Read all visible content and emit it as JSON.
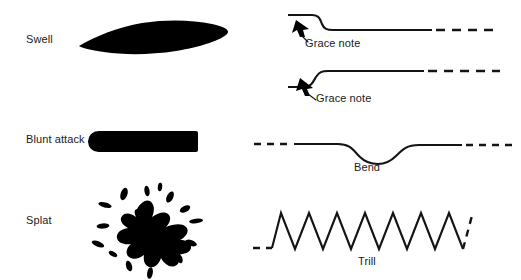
{
  "figure": {
    "background_color": "#ffffff",
    "ink_color": "#000000",
    "width": 521,
    "height": 280
  },
  "left_column": {
    "items": [
      {
        "id": "swell",
        "label": "Swell",
        "shape": "lens",
        "label_x": 26,
        "label_y": 40,
        "glyph_desc": "solid black lens / eye shape, pointed left tip, tapered right tip"
      },
      {
        "id": "blunt-attack",
        "label": "Blunt attack",
        "shape": "rounded-bar",
        "label_x": 26,
        "label_y": 140,
        "glyph_desc": "solid black horizontal bar with rounded ends"
      },
      {
        "id": "splat",
        "label": "Splat",
        "shape": "ink-splatter",
        "label_x": 26,
        "label_y": 221,
        "glyph_desc": "black ink splatter with radiating droplets"
      }
    ]
  },
  "right_column": {
    "items": [
      {
        "id": "grace-note-down",
        "label": "Grace note",
        "shape": "step-down-curve",
        "label_x": 305,
        "label_y": 44,
        "glyph_desc": "short high plateau stepping down to a long low line ending in dashes",
        "has_arrow": true,
        "dashed_tail": true
      },
      {
        "id": "grace-note-up",
        "label": "Grace note",
        "shape": "step-up-curve",
        "label_x": 315,
        "label_y": 99,
        "glyph_desc": "short low plateau stepping up to a long high line ending in dashes",
        "has_arrow": true,
        "dashed_tail": true
      },
      {
        "id": "bend",
        "label": "Bend",
        "shape": "dip-curve",
        "label_x": 355,
        "label_y": 168,
        "glyph_desc": "dashed line, solid line with a downward dip, returning to dashed line",
        "has_arrow": false,
        "dashed_tail": true
      },
      {
        "id": "trill",
        "label": "Trill",
        "shape": "zigzag",
        "label_x": 358,
        "label_y": 262,
        "glyph_desc": "dashed lead-in, eight sharp zigzag peaks, dashed lead-out",
        "has_arrow": false,
        "dashed_tail": true,
        "peak_count": 8
      }
    ]
  },
  "annotations": {
    "grace_note_arrow_1": "arrow pointing up-left to the step-down shoulder",
    "grace_note_arrow_2": "arrow pointing up-left to the step-up shoulder"
  }
}
